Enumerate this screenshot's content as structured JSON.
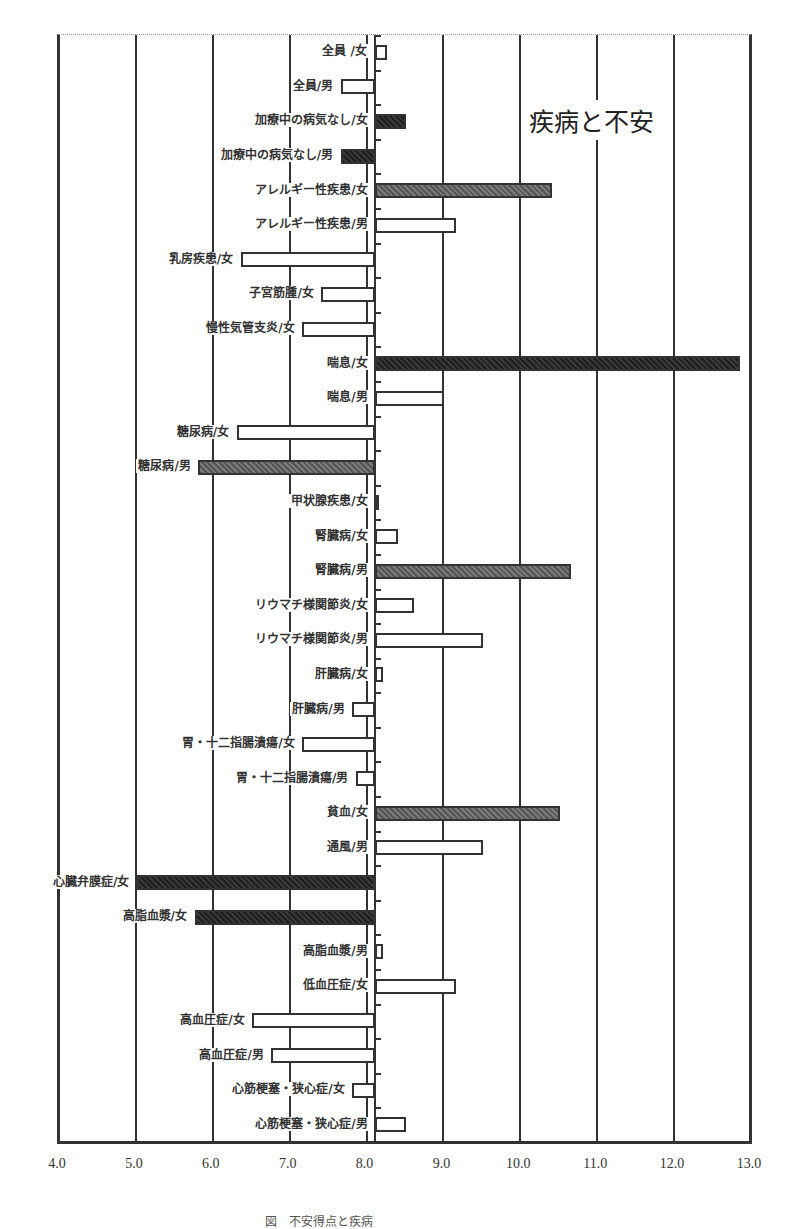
{
  "chart_data": {
    "type": "bar",
    "orientation": "horizontal",
    "title": "疾病と不安",
    "xlabel": "",
    "ylabel": "",
    "xlim": [
      4.0,
      13.0
    ],
    "baseline": 8.1,
    "xticks": [
      "4.0",
      "5.0",
      "6.0",
      "7.0",
      "8.0",
      "9.0",
      "10.0",
      "11.0",
      "12.0",
      "13.0"
    ],
    "grid": "vertical",
    "legend": null,
    "categories": [
      "全員 /女",
      "全員/男",
      "加療中の病気なし/女",
      "加療中の病気なし/男",
      "アレルギー性疾患/女",
      "アレルギー性疾患/男",
      "乳房疾患/女",
      "子宮筋腫/女",
      "慢性気管支炎/女",
      "喘息/女",
      "喘息/男",
      "糖尿病/女",
      "糖尿病/男",
      "甲状腺疾患/女",
      "腎臓病/女",
      "腎臓病/男",
      "リウマチ様関節炎/女",
      "リウマチ様関節炎/男",
      "肝臓病/女",
      "肝臓病/男",
      "胃・十二指腸潰瘍/女",
      "胃・十二指腸潰瘍/男",
      "貧血/女",
      "通風/男",
      "心臓弁膜症/女",
      "高脂血漿/女",
      "高脂血漿/男",
      "低血圧症/女",
      "高血圧症/女",
      "高血圧症/男",
      "心筋梗塞・狭心症/女",
      "心筋梗塞・狭心症/男"
    ],
    "values": [
      8.25,
      7.65,
      8.5,
      7.65,
      10.4,
      9.15,
      6.35,
      7.4,
      7.15,
      12.85,
      9.0,
      6.3,
      5.8,
      8.15,
      8.4,
      10.65,
      8.6,
      9.5,
      8.2,
      7.8,
      7.15,
      7.85,
      10.5,
      9.5,
      5.0,
      5.75,
      8.2,
      9.15,
      6.5,
      6.75,
      7.8,
      8.5
    ],
    "styles": [
      "white",
      "white",
      "dark",
      "dark",
      "gray",
      "white",
      "white",
      "white",
      "white",
      "dark",
      "white",
      "white",
      "gray",
      "white",
      "white",
      "gray",
      "white",
      "white",
      "white",
      "white",
      "white",
      "white",
      "gray",
      "white",
      "dark",
      "dark",
      "white",
      "white",
      "white",
      "white",
      "white",
      "white"
    ]
  },
  "caption": "図　不安得点と疾病"
}
